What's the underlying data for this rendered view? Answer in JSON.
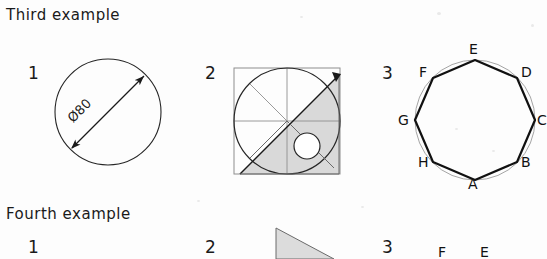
{
  "page": {
    "background_color": "#fdfdfd",
    "ink_color": "#1a1a1a",
    "shade_color": "#d8d8d8",
    "light_line_color": "#9a9a9a"
  },
  "sections": [
    {
      "key": "third",
      "heading": "Third example"
    },
    {
      "key": "fourth",
      "heading": "Fourth example"
    }
  ],
  "third_example": {
    "heading": "Third example",
    "figures": [
      {
        "number": "1",
        "type": "circle-with-diameter-dimension",
        "dimension_label": "Ø80",
        "circle": {
          "cx": 108,
          "cy": 112,
          "r": 53
        },
        "dimension_line": {
          "x1": 71,
          "y1": 149,
          "x2": 145,
          "y2": 75,
          "arrows": "both"
        }
      },
      {
        "number": "2",
        "type": "circle-octants-with-shaded-triangle",
        "circle": {
          "cx": 287,
          "cy": 121,
          "r": 53
        },
        "square": {
          "x": 234,
          "y": 68,
          "w": 106,
          "h": 106
        },
        "radial_lines": 8,
        "shaded_triangle": [
          [
            340,
            75
          ],
          [
            340,
            174
          ],
          [
            240,
            174
          ]
        ],
        "inner_circle": {
          "cx": 307,
          "cy": 146,
          "r": 13
        }
      },
      {
        "number": "3",
        "type": "octagon-inscribed-in-circle",
        "circle": {
          "cx": 475,
          "cy": 120,
          "r": 60
        },
        "vertices": [
          {
            "label": "A",
            "angle_deg": 90,
            "label_x": 468,
            "label_y": 178
          },
          {
            "label": "B",
            "angle_deg": 45,
            "label_x": 519,
            "label_y": 157
          },
          {
            "label": "C",
            "angle_deg": 0,
            "label_x": 537,
            "label_y": 112
          },
          {
            "label": "D",
            "angle_deg": 315,
            "label_x": 519,
            "label_y": 65
          },
          {
            "label": "E",
            "angle_deg": 270,
            "label_x": 468,
            "label_y": 41
          },
          {
            "label": "F",
            "angle_deg": 225,
            "label_x": 420,
            "label_y": 65
          },
          {
            "label": "G",
            "angle_deg": 180,
            "label_x": 400,
            "label_y": 112
          },
          {
            "label": "H",
            "angle_deg": 135,
            "label_x": 420,
            "label_y": 157
          }
        ]
      }
    ]
  },
  "fourth_example": {
    "heading": "Fourth example",
    "figures": [
      {
        "number": "1",
        "type": "cropped",
        "note": ""
      },
      {
        "number": "2",
        "type": "shaded-right-triangle-cropped",
        "triangle": [
          [
            276,
            228
          ],
          [
            276,
            259
          ],
          [
            330,
            259
          ]
        ]
      },
      {
        "number": "3",
        "type": "labels-cropped",
        "labels": [
          {
            "text": "F",
            "x": 440,
            "y": 246
          },
          {
            "text": "E",
            "x": 482,
            "y": 246
          }
        ]
      }
    ]
  }
}
